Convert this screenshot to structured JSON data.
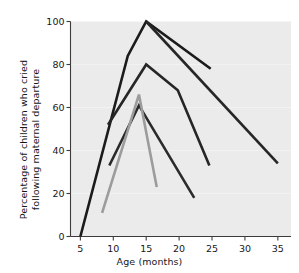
{
  "chart_data": {
    "type": "line",
    "title": "",
    "subtitle": "",
    "xlabel": "Age (months)",
    "ylabel": "Percentage of children who cried following maternal departure",
    "xlim": [
      3.5,
      37
    ],
    "ylim": [
      0,
      100
    ],
    "xticks": [
      5,
      10,
      15,
      20,
      25,
      30,
      35
    ],
    "xtick_labels": [
      "5",
      "10",
      "15",
      "20",
      "25",
      "30",
      "35"
    ],
    "yticks": [
      0,
      20,
      40,
      60,
      80,
      100
    ],
    "ytick_labels": [
      "0",
      "20",
      "40",
      "60",
      "80",
      "100"
    ],
    "grid": false,
    "legend": "none",
    "plot_background": "#ebebeb",
    "series": [
      {
        "name": "series-1",
        "color": "#1b1b1b",
        "linewidth": 2.6,
        "x": [
          5,
          12.2,
          15,
          24.8
        ],
        "y": [
          0,
          84,
          100,
          78
        ]
      },
      {
        "name": "series-2",
        "color": "#262626",
        "linewidth": 2.6,
        "x": [
          15,
          35
        ],
        "y": [
          100,
          34
        ]
      },
      {
        "name": "series-3",
        "color": "#262626",
        "linewidth": 2.6,
        "x": [
          9.2,
          15,
          19.8,
          24.6
        ],
        "y": [
          52,
          80,
          68,
          33
        ]
      },
      {
        "name": "series-4",
        "color": "#2b2b2b",
        "linewidth": 2.6,
        "x": [
          9.4,
          13.9,
          22.3
        ],
        "y": [
          33,
          61,
          18
        ]
      },
      {
        "name": "series-5",
        "color": "#9c9c9c",
        "linewidth": 2.6,
        "x": [
          8.3,
          13.9,
          16.6
        ],
        "y": [
          11,
          66,
          23
        ]
      }
    ]
  },
  "axes": {
    "x_title": "Age (months)",
    "y_title": "Percentage of children who cried following maternal departure"
  }
}
